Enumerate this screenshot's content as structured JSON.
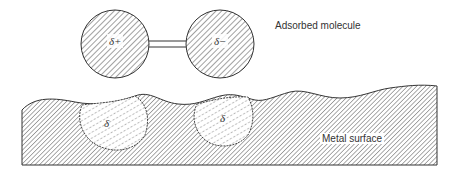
{
  "diagram": {
    "type": "schematic",
    "title": "",
    "labels": {
      "molecule": "Adsorbed molecule",
      "surface": "Metal surface"
    },
    "molecule": {
      "atoms": [
        {
          "charge_label": "δ+",
          "position": "left"
        },
        {
          "charge_label": "δ−",
          "position": "right"
        }
      ],
      "bond": "double line"
    },
    "surface": {
      "induced_charges": [
        {
          "charge_label": "δ",
          "position": "below left atom"
        },
        {
          "charge_label": "δ",
          "position": "below right atom"
        }
      ]
    },
    "colors": {
      "ink": "#333333",
      "background": "#ffffff"
    }
  }
}
